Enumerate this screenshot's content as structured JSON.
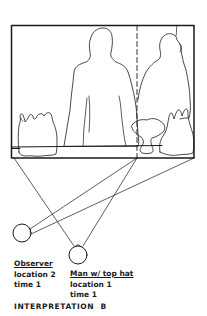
{
  "diagram": {
    "colors": {
      "ink": "#1a1a1a",
      "paper": "#ffffff"
    },
    "scene": {
      "description": "Framed view of a man's silhouette with bottles at left, a second seated figure, bowl and bottles at right, divided by a dashed vertical line"
    },
    "observer": {
      "title": "Observer",
      "location": "location 2",
      "time": "time 1"
    },
    "man": {
      "title": "Man w/ top hat",
      "location": "location 1",
      "time": "time 1"
    },
    "caption": "INTERPRETATION  B"
  }
}
